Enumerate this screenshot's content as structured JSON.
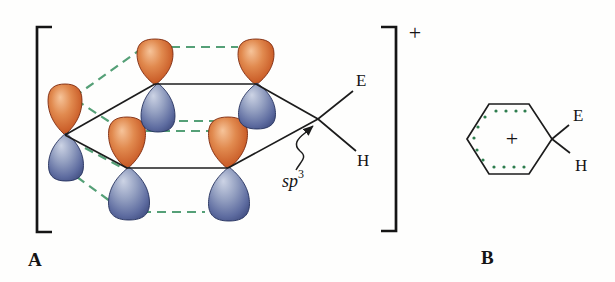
{
  "figure_type": "arenium-ion-orbital-diagram",
  "structure_a": {
    "label": "A",
    "bracket_charge": "+",
    "substituent_top": "E",
    "substituent_bottom": "H",
    "hybridization_base": "sp",
    "hybridization_sup": "3"
  },
  "structure_b": {
    "label": "B",
    "center_charge": "+",
    "substituent_top": "E",
    "substituent_bottom": "H"
  },
  "colors": {
    "orbital_orange_highlight": "#f6c49a",
    "orbital_orange_mid": "#e18a4f",
    "orbital_orange_dark": "#cb5f2a",
    "orbital_orange_edge": "#9d3a15",
    "orbital_orange_outline": "#7e2a0e",
    "orbital_blue_highlight": "#cdd4e5",
    "orbital_blue_mid": "#94a0c1",
    "orbital_blue_dark": "#5e6ca0",
    "orbital_blue_edge": "#333f72",
    "orbital_blue_outline": "#27335f",
    "overlap_dash_green": "#55a077",
    "aromatic_dot_green": "#2e7d4e",
    "bond_black": "#1c1c1c"
  }
}
